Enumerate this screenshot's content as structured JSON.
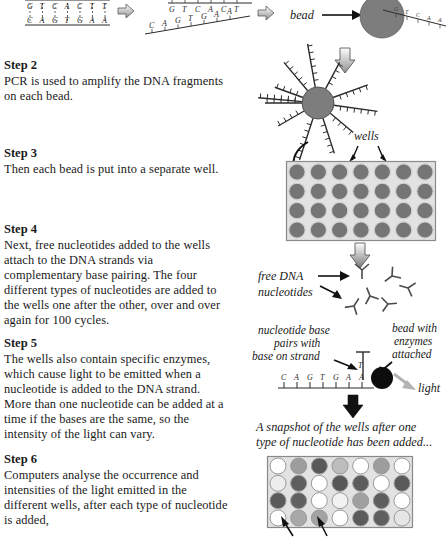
{
  "document": {
    "title": "DNA sequencing by synthesis — illustrated steps"
  },
  "steps": [
    {
      "id": "step2",
      "title": "Step 2",
      "body": "PCR is used to amplify the DNA fragments on each bead."
    },
    {
      "id": "step3",
      "title": "Step 3",
      "body": "Then each bead is put into a separate well."
    },
    {
      "id": "step4",
      "title": "Step 4",
      "body": "Next, free nucleotides added to the wells attach to the DNA strands via complementary base pairing.  The four different types of nucleotides are added to the wells one after the other, over and over again for 100 cycles."
    },
    {
      "id": "step5",
      "title": "Step 5",
      "body": "The wells also contain specific enzymes, which cause light to be emitted when a nucleotide is added to the DNA strand. More than one nucleotide can be added at a time if the bases are the same, so the intensity of the light can vary."
    },
    {
      "id": "step6",
      "title": "Step 6",
      "body": "Computers analyse the occurrence and intensities of the light emitted in the different wells, after each type of nucleotide is added,"
    }
  ],
  "diagram": {
    "double_strand": {
      "top_bases": [
        "G",
        "T",
        "C",
        "A",
        "C",
        "T",
        "T"
      ],
      "bottom_bases": [
        "C",
        "A",
        "G",
        "T",
        "G",
        "A",
        "A"
      ]
    },
    "separated_strands": {
      "top_bases": [
        "G",
        "T",
        "C",
        "A",
        "C",
        "T"
      ],
      "bottom_bases": [
        "C",
        "A",
        "G",
        "T",
        "G",
        "A",
        "A"
      ]
    },
    "bead_label": "bead",
    "bead_strand_bases": [
      "G",
      "T",
      "C",
      "A",
      "A"
    ],
    "wells_label": "wells",
    "free_nucleotides_label_line1": "free DNA",
    "free_nucleotides_label_line2": "nucleotides",
    "pairing_label_line1": "nucleotide base",
    "pairing_label_line2": "pairs with",
    "pairing_label_line3": "base on strand",
    "bead_enzymes_label_line1": "bead with",
    "bead_enzymes_label_line2": "enzymes",
    "bead_enzymes_label_line3": "attached",
    "light_label": "light",
    "strand_bases": [
      "C",
      "A",
      "G",
      "T",
      "G",
      "A",
      "A"
    ],
    "snapshot_caption_line1": "A snapshot of the wells after one",
    "snapshot_caption_line2": "type of nucleotide has been added...",
    "well_plate_top": {
      "rows": 4,
      "cols": 7,
      "shade": "#757575"
    },
    "well_plate_bottom": {
      "rows": 4,
      "cols": 7,
      "shades": [
        [
          "#ffffff",
          "#9d9d9d",
          "#595959",
          "#bdbdbd",
          "#ffffff",
          "#9d9d9d",
          "#ffffff"
        ],
        [
          "#ededed",
          "#5e5e5e",
          "#ffffff",
          "#575757",
          "#5c5c5c",
          "#ffffff",
          "#5a5a5a"
        ],
        [
          "#5a5a5a",
          "#616161",
          "#ffffff",
          "#f2f2f2",
          "#a0a0a0",
          "#5e5e5e",
          "#ffffff"
        ],
        [
          "#ffffff",
          "#a8a8a8",
          "#a3a3a3",
          "#ffffff",
          "#5b5b5b",
          "#5f5f5f",
          "#e6e6e6"
        ]
      ]
    }
  },
  "colors": {
    "bead_fill": "#7d7d7d",
    "bead_dark": "#111111",
    "plate_bg": "#e2e2e2",
    "plate_border": "#8a8a8a",
    "ink": "#1a1a1a",
    "light_arrow": "#b3b3b3"
  }
}
